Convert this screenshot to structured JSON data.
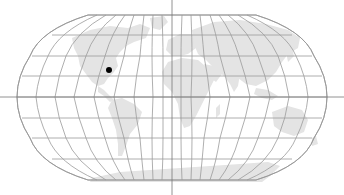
{
  "map": {
    "projection": "robinson",
    "width": 344,
    "height": 195,
    "center": {
      "x": 172,
      "y": 97
    },
    "colors": {
      "background": "#ffffff",
      "land": "#e4e4e4",
      "graticule": "#9a9a9a",
      "crosshair": "#777777",
      "marker": "#000000"
    },
    "graticule": {
      "parallel_step_deg": 20,
      "meridian_step_deg": 20
    },
    "crosshair": {
      "x": 172,
      "y": 97
    },
    "marker": {
      "label": "location-marker",
      "x": 109,
      "y": 70,
      "radius": 3
    }
  }
}
